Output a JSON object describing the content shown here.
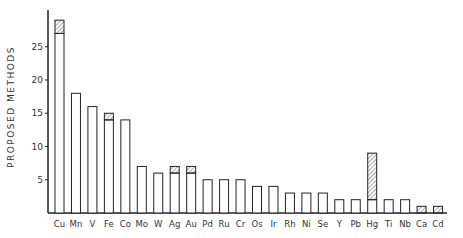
{
  "chart_data": {
    "type": "bar",
    "title": "",
    "xlabel": "",
    "ylabel": "PROPOSED METHODS",
    "ylim": [
      0,
      30
    ],
    "yticks": [
      5,
      10,
      15,
      20,
      25
    ],
    "grid": false,
    "legend": null,
    "categories": [
      "Cu",
      "Mn",
      "V",
      "Fe",
      "Co",
      "Mo",
      "W",
      "Ag",
      "Au",
      "Pd",
      "Ru",
      "Cr",
      "Os",
      "Ir",
      "Rh",
      "Ni",
      "Se",
      "Y",
      "Pb",
      "Hg",
      "Ti",
      "Nb",
      "Ca",
      "Cd"
    ],
    "series": [
      {
        "name": "plain",
        "style": "open",
        "values": [
          27,
          18,
          16,
          14,
          14,
          7,
          6,
          6,
          6,
          5,
          5,
          5,
          4,
          4,
          3,
          3,
          3,
          2,
          2,
          2,
          2,
          2,
          0,
          0
        ]
      },
      {
        "name": "hatched",
        "style": "hatched",
        "values": [
          2,
          0,
          0,
          1,
          0,
          0,
          0,
          1,
          1,
          0,
          0,
          0,
          0,
          0,
          0,
          0,
          0,
          0,
          0,
          7,
          0,
          0,
          1,
          1
        ]
      }
    ],
    "totals": [
      29,
      18,
      16,
      15,
      14,
      7,
      6,
      7,
      7,
      5,
      5,
      5,
      4,
      4,
      3,
      3,
      3,
      2,
      2,
      9,
      2,
      2,
      1,
      1
    ]
  }
}
